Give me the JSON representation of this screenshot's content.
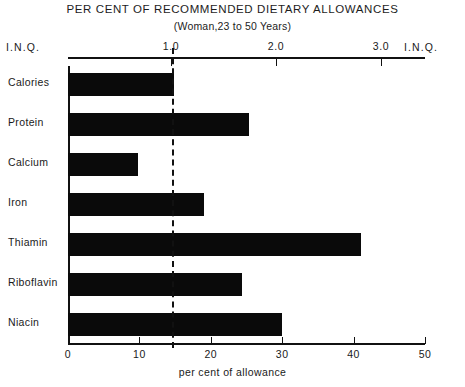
{
  "chart_data": {
    "type": "bar",
    "orientation": "horizontal",
    "title": "PER CENT OF RECOMMENDED DIETARY ALLOWANCES",
    "subtitle": "(Woman,23 to 50 Years)",
    "categories": [
      "Calories",
      "Protein",
      "Calcium",
      "Iron",
      "Thiamin",
      "Riboflavin",
      "Niacin"
    ],
    "values": [
      14.8,
      25.3,
      9.8,
      19.0,
      41.0,
      24.3,
      30.0
    ],
    "xlabel": "per cent of allowance",
    "ylabel": "",
    "xlim": [
      0,
      50
    ],
    "xticks": [
      0,
      10,
      20,
      30,
      40,
      50
    ],
    "xtick_labels": [
      "0",
      "10",
      "20",
      "30",
      "40",
      "50"
    ],
    "grid": false,
    "legend": null,
    "bar_color": "#0a0a0a",
    "secondary_axis": {
      "position": "top",
      "label_left": "I.N.Q.",
      "label_right": "I.N.Q.",
      "ticks": [
        1.0,
        2.0,
        3.0
      ],
      "tick_labels": [
        "1.0",
        "2.0",
        "3.0"
      ],
      "range": [
        0,
        3.4
      ]
    },
    "reference_line": {
      "value": 14.5,
      "style": "dashed",
      "color": "#111111"
    },
    "annotations": []
  },
  "axis_top": {
    "label_left": "I.N.Q.",
    "label_right": "I.N.Q.",
    "ticks": [
      {
        "label": "1.0",
        "x": 1.0
      },
      {
        "label": "2.0",
        "x": 2.0
      },
      {
        "label": "3.0",
        "x": 3.0
      }
    ]
  },
  "axis_bottom": {
    "title": "per cent of allowance",
    "ticks": [
      {
        "label": "0",
        "value": 0
      },
      {
        "label": "10",
        "value": 10
      },
      {
        "label": "20",
        "value": 20
      },
      {
        "label": "30",
        "value": 30
      },
      {
        "label": "40",
        "value": 40
      },
      {
        "label": "50",
        "value": 50
      }
    ]
  },
  "rows": [
    {
      "label": "Calories",
      "value": 14.8
    },
    {
      "label": "Protein",
      "value": 25.3
    },
    {
      "label": "Calcium",
      "value": 9.8
    },
    {
      "label": "Iron",
      "value": 19.0
    },
    {
      "label": "Thiamin",
      "value": 41.0
    },
    {
      "label": "Riboflavin",
      "value": 24.3
    },
    {
      "label": "Niacin",
      "value": 30.0
    }
  ]
}
